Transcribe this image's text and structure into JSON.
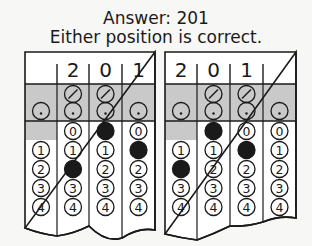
{
  "heading": {
    "answer": "Answer: 201",
    "note": "Either position is correct."
  },
  "grids": [
    {
      "name": "left-grid",
      "entered": [
        "",
        "2",
        "0",
        "1"
      ],
      "filled": [
        "",
        "2",
        "0",
        "1"
      ]
    },
    {
      "name": "right-grid",
      "entered": [
        "2",
        "0",
        "1",
        ""
      ],
      "filled": [
        "2",
        "0",
        "1",
        ""
      ]
    }
  ],
  "bubble_labels": {
    "slash": "/",
    "dot": ".",
    "digits": [
      "0",
      "1",
      "2",
      "3",
      "4"
    ]
  },
  "colors": {
    "ink": "#1a1a1a",
    "shade": "#c9c9c9",
    "paper": "#ffffff"
  }
}
